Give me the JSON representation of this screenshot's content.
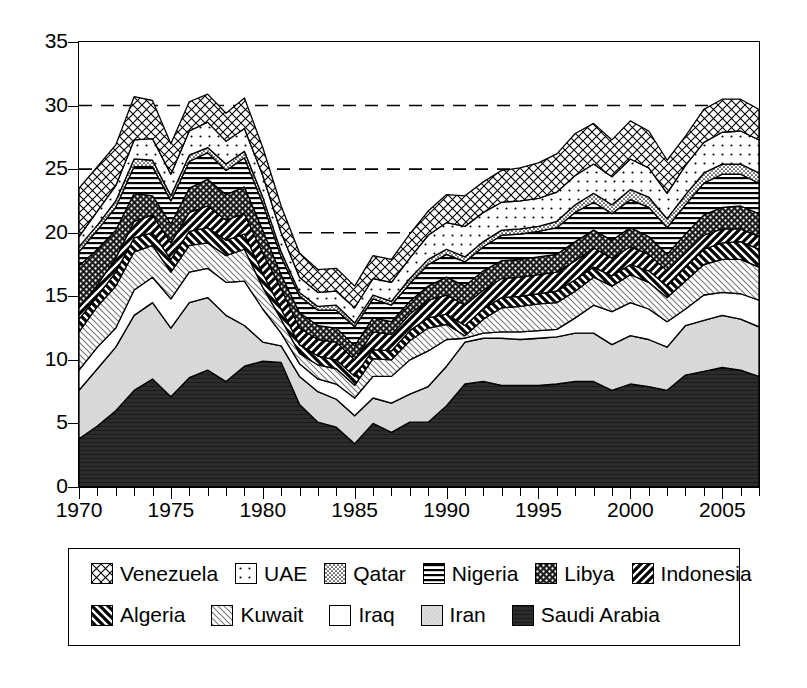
{
  "chart_data": {
    "type": "area",
    "title": "",
    "subtitle": "",
    "xlabel": "",
    "ylabel": "",
    "xlim": [
      1970,
      2007
    ],
    "ylim": [
      0,
      35
    ],
    "yticks": [
      0,
      5,
      10,
      15,
      20,
      25,
      30,
      35
    ],
    "xticks": [
      1970,
      1975,
      1980,
      1985,
      1990,
      1995,
      2000,
      2005
    ],
    "xtick_step_minor": 1,
    "grid": "horizontal dashed gridlines at 20, 25, 30",
    "stacked": true,
    "legend_position": "below-plot",
    "x": [
      1970,
      1971,
      1972,
      1973,
      1974,
      1975,
      1976,
      1977,
      1978,
      1979,
      1980,
      1981,
      1982,
      1983,
      1984,
      1985,
      1986,
      1987,
      1988,
      1989,
      1990,
      1991,
      1992,
      1993,
      1994,
      1995,
      1996,
      1997,
      1998,
      1999,
      2000,
      2001,
      2002,
      2003,
      2004,
      2005,
      2006,
      2007
    ],
    "series": [
      {
        "name": "Saudi Arabia",
        "pattern": "solid-dark",
        "color": "#2b2b2b",
        "values": [
          3.8,
          4.8,
          6.0,
          7.6,
          8.5,
          7.1,
          8.6,
          9.2,
          8.3,
          9.5,
          9.9,
          9.8,
          6.5,
          5.1,
          4.7,
          3.4,
          5.0,
          4.3,
          5.1,
          5.1,
          6.4,
          8.1,
          8.3,
          8.0,
          8.0,
          8.0,
          8.1,
          8.3,
          8.3,
          7.6,
          8.1,
          7.9,
          7.6,
          8.8,
          9.1,
          9.4,
          9.2,
          8.7
        ]
      },
      {
        "name": "Iran",
        "pattern": "light-gray-solid",
        "color": "#d9d9d9",
        "values": [
          3.8,
          4.5,
          5.0,
          5.9,
          6.0,
          5.4,
          5.9,
          5.7,
          5.2,
          3.2,
          1.5,
          1.3,
          2.2,
          2.4,
          2.2,
          2.2,
          2.0,
          2.3,
          2.2,
          2.8,
          3.1,
          3.3,
          3.4,
          3.7,
          3.6,
          3.7,
          3.7,
          3.8,
          3.8,
          3.6,
          3.8,
          3.7,
          3.4,
          3.9,
          4.0,
          4.1,
          4.0,
          3.9
        ]
      },
      {
        "name": "Iraq",
        "pattern": "empty-white",
        "color": "#ffffff",
        "values": [
          1.6,
          1.7,
          1.5,
          2.0,
          2.0,
          2.3,
          2.4,
          2.3,
          2.6,
          3.5,
          2.6,
          1.0,
          1.0,
          1.0,
          1.2,
          1.4,
          1.7,
          2.1,
          2.7,
          2.8,
          2.1,
          0.3,
          0.4,
          0.5,
          0.6,
          0.6,
          0.6,
          1.2,
          2.2,
          2.6,
          2.6,
          2.4,
          2.0,
          1.3,
          2.0,
          1.8,
          2.0,
          2.1
        ]
      },
      {
        "name": "Kuwait",
        "pattern": "light-thin-diagonal",
        "color": "#efefef",
        "values": [
          3.0,
          3.2,
          3.3,
          3.0,
          2.5,
          2.1,
          2.1,
          2.0,
          2.1,
          2.5,
          1.7,
          1.1,
          0.8,
          1.1,
          1.2,
          1.0,
          1.4,
          1.3,
          1.5,
          1.8,
          1.2,
          0.2,
          1.1,
          1.9,
          2.0,
          2.1,
          2.1,
          2.1,
          2.2,
          2.0,
          2.2,
          2.1,
          1.9,
          2.2,
          2.4,
          2.6,
          2.7,
          2.6
        ]
      },
      {
        "name": "Algeria",
        "pattern": "bold-forward-diagonal",
        "color": "#ffffff",
        "values": [
          1.0,
          0.8,
          1.1,
          1.1,
          1.0,
          1.0,
          1.1,
          1.2,
          1.2,
          1.2,
          1.1,
          0.8,
          0.7,
          0.7,
          0.7,
          0.7,
          0.7,
          0.7,
          0.8,
          0.8,
          0.8,
          0.8,
          0.8,
          0.8,
          0.8,
          0.8,
          0.9,
          0.9,
          0.8,
          0.8,
          0.8,
          0.9,
          0.9,
          1.1,
          1.2,
          1.3,
          1.4,
          1.4
        ]
      },
      {
        "name": "Indonesia",
        "pattern": "thick-back-diagonal",
        "color": "#ffffff",
        "values": [
          0.9,
          0.9,
          1.1,
          1.3,
          1.4,
          1.3,
          1.5,
          1.7,
          1.6,
          1.6,
          1.6,
          1.6,
          1.3,
          1.3,
          1.4,
          1.3,
          1.4,
          1.3,
          1.3,
          1.4,
          1.5,
          1.6,
          1.5,
          1.5,
          1.5,
          1.5,
          1.5,
          1.5,
          1.5,
          1.4,
          1.4,
          1.3,
          1.2,
          1.1,
          1.1,
          1.1,
          1.0,
          1.0
        ]
      },
      {
        "name": "Libya",
        "pattern": "dark-with-dots",
        "color": "#262626",
        "values": [
          3.3,
          2.8,
          2.2,
          2.2,
          1.5,
          1.5,
          1.9,
          2.1,
          2.0,
          2.1,
          1.8,
          1.1,
          1.2,
          1.1,
          1.1,
          1.1,
          1.1,
          1.0,
          1.0,
          1.1,
          1.4,
          1.5,
          1.5,
          1.4,
          1.4,
          1.4,
          1.4,
          1.5,
          1.4,
          1.4,
          1.5,
          1.4,
          1.3,
          1.5,
          1.6,
          1.7,
          1.8,
          1.8
        ]
      },
      {
        "name": "Nigeria",
        "pattern": "horizontal-lines",
        "color": "#ffffff",
        "values": [
          1.1,
          1.5,
          1.8,
          2.1,
          2.3,
          1.8,
          2.1,
          2.1,
          1.9,
          2.3,
          2.1,
          1.4,
          1.3,
          1.2,
          1.4,
          1.5,
          1.5,
          1.3,
          1.4,
          1.7,
          1.8,
          1.9,
          1.9,
          2.0,
          2.0,
          2.0,
          2.1,
          2.3,
          2.2,
          2.1,
          2.2,
          2.3,
          2.1,
          2.3,
          2.5,
          2.6,
          2.5,
          2.4
        ]
      },
      {
        "name": "Qatar",
        "pattern": "fine-stipple",
        "color": "#8f8f8f",
        "values": [
          0.4,
          0.4,
          0.5,
          0.6,
          0.5,
          0.4,
          0.5,
          0.4,
          0.5,
          0.5,
          0.5,
          0.4,
          0.3,
          0.3,
          0.4,
          0.3,
          0.3,
          0.3,
          0.4,
          0.4,
          0.4,
          0.4,
          0.4,
          0.4,
          0.4,
          0.4,
          0.5,
          0.6,
          0.7,
          0.7,
          0.8,
          0.8,
          0.7,
          0.8,
          0.8,
          0.8,
          0.8,
          0.8
        ]
      },
      {
        "name": "UAE",
        "pattern": "sparse-dots",
        "color": "#fafafa",
        "values": [
          0.8,
          1.1,
          1.2,
          1.5,
          1.7,
          1.7,
          1.9,
          2.0,
          1.8,
          1.8,
          1.7,
          1.5,
          1.2,
          1.1,
          1.1,
          1.2,
          1.3,
          1.5,
          1.6,
          1.9,
          2.1,
          2.4,
          2.3,
          2.2,
          2.2,
          2.2,
          2.3,
          2.3,
          2.3,
          2.2,
          2.4,
          2.3,
          2.0,
          2.3,
          2.4,
          2.5,
          2.6,
          2.6
        ]
      },
      {
        "name": "Venezuela",
        "pattern": "cross-hatch",
        "color": "#ffffff",
        "values": [
          3.8,
          3.5,
          3.2,
          3.4,
          3.0,
          2.4,
          2.3,
          2.2,
          2.2,
          2.4,
          2.2,
          2.1,
          1.9,
          1.8,
          1.8,
          1.7,
          1.8,
          1.8,
          1.9,
          1.9,
          2.2,
          2.4,
          2.4,
          2.5,
          2.6,
          2.8,
          3.0,
          3.3,
          3.2,
          2.9,
          3.0,
          2.9,
          2.6,
          2.3,
          2.6,
          2.6,
          2.5,
          2.4
        ]
      }
    ],
    "totals_notes": {
      "1970": 23.5,
      "1973": 30.6,
      "1975": 26.5,
      "1977": 30.4,
      "1979": 30.5,
      "1985": 14.2,
      "1990": 22.9,
      "1998": 28.9,
      "2005": 30.6,
      "2007": 26.8
    }
  },
  "axis": {
    "y_labels": [
      "35",
      "30",
      "25",
      "20",
      "15",
      "10",
      "5",
      "0"
    ],
    "x_labels": [
      "1970",
      "1975",
      "1980",
      "1985",
      "1990",
      "1995",
      "2000",
      "2005"
    ]
  },
  "legend": {
    "row1": [
      {
        "label": "Venezuela",
        "pattern": "cross-hatch"
      },
      {
        "label": "UAE",
        "pattern": "sparse-dots"
      },
      {
        "label": "Qatar",
        "pattern": "fine-stipple"
      },
      {
        "label": "Nigeria",
        "pattern": "horizontal-lines"
      },
      {
        "label": "Libya",
        "pattern": "dark-with-dots"
      },
      {
        "label": "Indonesia",
        "pattern": "thick-back-diagonal"
      }
    ],
    "row2": [
      {
        "label": "Algeria",
        "pattern": "bold-forward-diagonal"
      },
      {
        "label": "Kuwait",
        "pattern": "light-thin-diagonal"
      },
      {
        "label": "Iraq",
        "pattern": "empty-white"
      },
      {
        "label": "Iran",
        "pattern": "light-gray-solid"
      },
      {
        "label": "Saudi Arabia",
        "pattern": "solid-dark"
      }
    ]
  }
}
